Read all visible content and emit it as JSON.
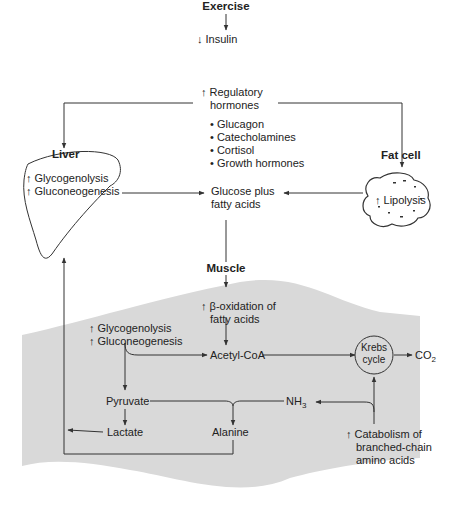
{
  "title": "Exercise",
  "insulin": "↓ Insulin",
  "regulatory": {
    "line1": "↑ Regulatory",
    "line2": "hormones",
    "items": [
      "Glucagon",
      "Catecholamines",
      "Cortisol",
      "Growth hormones"
    ]
  },
  "liver": {
    "label": "Liver",
    "line1": "↑ Glycogenolysis",
    "line2": "↑ Gluconeogenesis"
  },
  "fat_cell": {
    "label": "Fat cell",
    "text": "↑ Lipolysis"
  },
  "glucose": {
    "line1": "Glucose plus",
    "line2": "fatty acids"
  },
  "muscle": {
    "label": "Muscle",
    "beta_ox_line1": "↑ β-oxidation of",
    "beta_ox_line2": "fatty acids",
    "glyco_line1": "↑ Glycogenolysis",
    "glyco_line2": "↑ Gluconeogenesis",
    "acetyl_coa": "Acetyl-CoA",
    "krebs_line1": "Krebs",
    "krebs_line2": "cycle",
    "co2": "CO",
    "co2_sub": "2",
    "pyruvate": "Pyruvate",
    "nh3": "NH",
    "nh3_sub": "3",
    "lactate": "Lactate",
    "alanine": "Alanine",
    "catabolism_line1": "↑ Catabolism of",
    "catabolism_line2": "branched-chain",
    "catabolism_line3": "amino acids"
  },
  "colors": {
    "muscle_fill": "#d9d9d9",
    "line": "#333333"
  }
}
